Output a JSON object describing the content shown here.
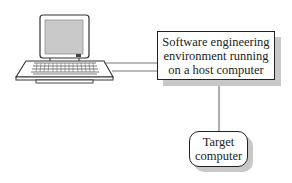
{
  "host_box": {
    "lines": [
      "Software engineering",
      "environment running",
      "on a host computer"
    ]
  },
  "target_box": {
    "lines": [
      "Target",
      "computer"
    ]
  },
  "icons": {
    "workstation": "computer-terminal-icon"
  }
}
